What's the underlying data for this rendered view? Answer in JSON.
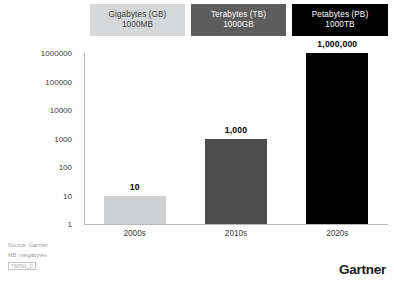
{
  "header": {
    "boxes": [
      {
        "title": "Gigabytes (GB)",
        "subtitle": "1000MB"
      },
      {
        "title": "Terabytes (TB)",
        "subtitle": "1000GB"
      },
      {
        "title": "Petabytes (PB)",
        "subtitle": "1000TB"
      }
    ]
  },
  "footer": {
    "source": "Source: Gartner",
    "note": "MB: megabytes",
    "doc_id": "766501_C",
    "logo": "Gartner"
  },
  "chart_data": {
    "type": "bar",
    "title": "",
    "xlabel": "",
    "ylabel": "",
    "scale": "log",
    "grid": false,
    "legend": "none",
    "categories": [
      "2000s",
      "2010s",
      "2020s"
    ],
    "values": [
      10,
      1000,
      1000000
    ],
    "value_labels": [
      "10",
      "1,000",
      "1,000,000"
    ],
    "series_names": [
      "Gigabytes (GB)",
      "Terabytes (TB)",
      "Petabytes (PB)"
    ],
    "bar_colors": [
      "#cfd1d2",
      "#4d4d4d",
      "#000000"
    ],
    "ylim": [
      1,
      1000000
    ],
    "yticks": [
      1,
      10,
      100,
      1000,
      10000,
      100000,
      1000000
    ],
    "ytick_labels": [
      "1",
      "10",
      "100",
      "1000",
      "10000",
      "100000",
      "1000000"
    ]
  },
  "colors": {
    "axis": "#b9b9b9",
    "text": "#3d3d3d",
    "background": "#ffffff",
    "box_light": "#d5d7d8",
    "box_medium": "#5d5d5d",
    "box_dark": "#000000"
  }
}
